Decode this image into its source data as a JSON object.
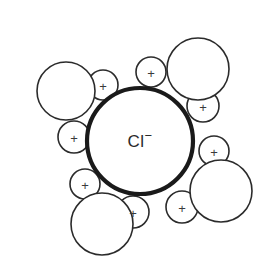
{
  "diagram": {
    "background_color": "#ffffff",
    "stroke_color": "#2b2b2b",
    "ion_stroke_color": "#1a1a1a",
    "plus_color": "#3a3a3a",
    "ion": {
      "label": "Cl",
      "charge": "−",
      "full_label": "Cl−",
      "cx": 140,
      "cy": 141,
      "r": 53
    },
    "hydrogen_symbol": "+",
    "water_molecules": [
      {
        "name": "water-top-left",
        "oxygen": {
          "cx": 66,
          "cy": 91,
          "r": 29
        },
        "hydrogens": [
          {
            "name": "hydrogen-top-left-upper",
            "cx": 103,
            "cy": 85,
            "r": 15
          },
          {
            "name": "hydrogen-top-left-lower",
            "cx": 74,
            "cy": 137,
            "r": 16
          }
        ]
      },
      {
        "name": "water-top-right",
        "oxygen": {
          "cx": 198,
          "cy": 69,
          "r": 31
        },
        "hydrogens": [
          {
            "name": "hydrogen-top-right-left",
            "cx": 151,
            "cy": 72,
            "r": 15
          },
          {
            "name": "hydrogen-top-right-lower",
            "cx": 203,
            "cy": 106,
            "r": 16
          }
        ]
      },
      {
        "name": "water-right",
        "oxygen": {
          "cx": 221,
          "cy": 191,
          "r": 31
        },
        "hydrogens": [
          {
            "name": "hydrogen-right-upper",
            "cx": 214,
            "cy": 151,
            "r": 15
          },
          {
            "name": "hydrogen-right-lower",
            "cx": 182,
            "cy": 207,
            "r": 16
          }
        ]
      },
      {
        "name": "water-bottom",
        "oxygen": {
          "cx": 102,
          "cy": 224,
          "r": 31
        },
        "hydrogens": [
          {
            "name": "hydrogen-bottom-upper",
            "cx": 85,
            "cy": 184,
            "r": 15
          },
          {
            "name": "hydrogen-bottom-right",
            "cx": 133,
            "cy": 212,
            "r": 16
          }
        ]
      }
    ]
  }
}
